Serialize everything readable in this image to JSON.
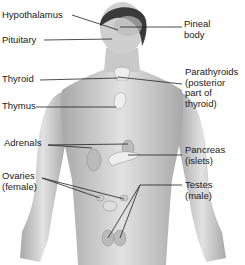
{
  "figure": {
    "labels_left": [
      {
        "id": "hypothalamus",
        "text": "Hypothalamus",
        "x": 2,
        "y": 10
      },
      {
        "id": "pituitary",
        "text": "Pituitary",
        "x": 2,
        "y": 35
      },
      {
        "id": "thyroid",
        "text": "Thyroid",
        "x": 2,
        "y": 74
      },
      {
        "id": "thymus",
        "text": "Thymus",
        "x": 2,
        "y": 101
      },
      {
        "id": "adrenals",
        "text": "Adrenals",
        "x": 4,
        "y": 138
      },
      {
        "id": "ovaries",
        "text": "Ovaries\n(female)",
        "x": 2,
        "y": 171
      }
    ],
    "labels_right": [
      {
        "id": "pineal",
        "text": "Pineal\nbody",
        "x": 184,
        "y": 19
      },
      {
        "id": "parathyroids",
        "text": "Parathyroids\n(posterior\npart of\nthyroid)",
        "x": 185,
        "y": 67
      },
      {
        "id": "pancreas",
        "text": "Pancreas\n(islets)",
        "x": 185,
        "y": 145
      },
      {
        "id": "testes",
        "text": "Testes\n(male)",
        "x": 185,
        "y": 180
      }
    ]
  },
  "colors": {
    "skin": "#d9d9d9",
    "shade": "#a9a9a9",
    "hair": "#3a3a3a",
    "line": "#222222",
    "organ": "#eeeeee"
  }
}
